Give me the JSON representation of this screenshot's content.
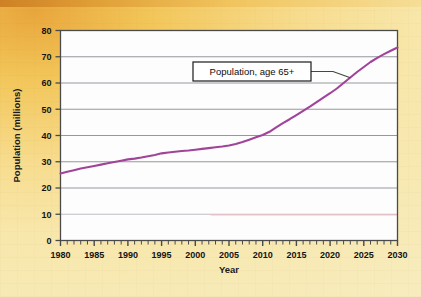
{
  "figure": {
    "background_color": "#f7e5a6",
    "plot_background_color": "#fdfdfd",
    "frame_color": "#4a4a4a",
    "gridline_color": "#8d8d99",
    "line_color": "#a0439a",
    "baseline_tint_color": "#f0b9c4"
  },
  "callout": {
    "label": "Population, age 65+",
    "border_color": "#1a1a1a",
    "fill_color": "#ffffff",
    "leader_color": "#3d4a3d"
  },
  "chart_data": {
    "type": "line",
    "title": "",
    "xlabel": "Year",
    "ylabel": "Population (millions)",
    "xlim": [
      1980,
      2030
    ],
    "ylim": [
      0,
      80
    ],
    "grid": true,
    "legend_position": "inline-callout",
    "x_tick_labels": [
      "1980",
      "1985",
      "1990",
      "1995",
      "2000",
      "2005",
      "2010",
      "2015",
      "2020",
      "2025",
      "2030"
    ],
    "x_tick_values": [
      1980,
      1985,
      1990,
      1995,
      2000,
      2005,
      2010,
      2015,
      2020,
      2025,
      2030
    ],
    "x_minor_tick_interval": 1,
    "y_tick_labels": [
      "0",
      "10",
      "20",
      "30",
      "40",
      "50",
      "60",
      "70",
      "80"
    ],
    "y_tick_values": [
      0,
      10,
      20,
      30,
      40,
      50,
      60,
      70,
      80
    ],
    "annotations": [
      {
        "text": "Population, age 65+",
        "points_to_x": 2023,
        "points_to_y": 62
      }
    ],
    "series": [
      {
        "name": "Population, age 65+",
        "units": "millions",
        "color": "#a0439a",
        "x": [
          1980,
          1981,
          1982,
          1983,
          1984,
          1985,
          1986,
          1987,
          1988,
          1989,
          1990,
          1991,
          1992,
          1993,
          1994,
          1995,
          1996,
          1997,
          1998,
          1999,
          2000,
          2001,
          2002,
          2003,
          2004,
          2005,
          2006,
          2007,
          2008,
          2009,
          2010,
          2011,
          2012,
          2013,
          2014,
          2015,
          2016,
          2017,
          2018,
          2019,
          2020,
          2021,
          2022,
          2023,
          2024,
          2025,
          2026,
          2027,
          2028,
          2029,
          2030
        ],
        "values": [
          25.5,
          26.2,
          26.8,
          27.4,
          27.9,
          28.4,
          28.9,
          29.4,
          29.9,
          30.4,
          30.9,
          31.2,
          31.6,
          32.1,
          32.6,
          33.2,
          33.5,
          33.8,
          34.1,
          34.3,
          34.6,
          34.9,
          35.2,
          35.5,
          35.8,
          36.2,
          36.8,
          37.5,
          38.4,
          39.3,
          40.2,
          41.4,
          43.1,
          44.7,
          46.2,
          47.8,
          49.4,
          51.0,
          52.7,
          54.4,
          56.1,
          57.9,
          60.0,
          62.1,
          64.2,
          66.1,
          68.0,
          69.6,
          71.0,
          72.3,
          73.5
        ]
      }
    ]
  }
}
